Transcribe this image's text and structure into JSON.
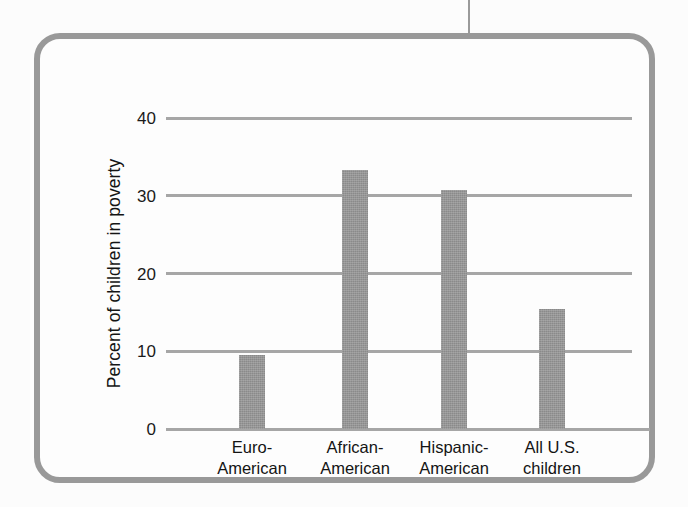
{
  "figure": {
    "frame_color": "#999999",
    "background_color": "#fdfdfd",
    "rule_color": "#9a9a9a"
  },
  "chart_data": {
    "type": "bar",
    "title": "",
    "xlabel": "",
    "ylabel": "Percent of children in poverty",
    "categories": [
      "Euro-\nAmerican",
      "African-\nAmerican",
      "Hispanic-\nAmerican",
      "All U.S.\nchildren"
    ],
    "category_lines": [
      [
        "Euro-",
        "American"
      ],
      [
        "African-",
        "American"
      ],
      [
        "Hispanic-",
        "American"
      ],
      [
        "All U.S.",
        "children"
      ]
    ],
    "values": [
      9.5,
      33.3,
      30.7,
      15.5
    ],
    "ylim": [
      0,
      40
    ],
    "yticks": [
      0,
      10,
      20,
      30,
      40
    ],
    "ytick_labels": [
      "0",
      "10",
      "20",
      "30",
      "40"
    ],
    "grid": true,
    "grid_color": "#a6a6a6",
    "bar_color": "#8a8a8a",
    "legend": null,
    "legend_position": "none"
  }
}
